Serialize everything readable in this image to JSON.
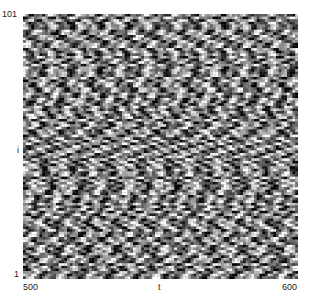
{
  "chart_data": {
    "type": "heatmap",
    "title": "",
    "xlabel": "t",
    "ylabel": "i",
    "x_ticks": [
      "500",
      "600"
    ],
    "y_ticks": [
      "1",
      "101"
    ],
    "xlim": [
      500,
      600
    ],
    "ylim": [
      1,
      101
    ],
    "colormap": "gray",
    "grid": false,
    "legend": null
  },
  "labels": {
    "y_top": "101",
    "y_mid": "i",
    "y_bottom": "1",
    "x_left": "500",
    "x_mid": "t",
    "x_right": "600"
  },
  "render": {
    "cols": 100,
    "rows": 101,
    "seed": 7
  }
}
